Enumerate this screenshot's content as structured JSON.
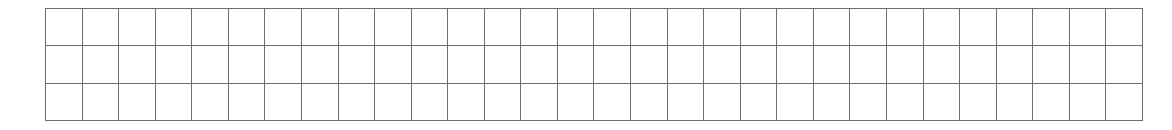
{
  "grid": {
    "rows": 3,
    "columns": 30,
    "line_color": "#6e6e6e",
    "background": "#ffffff",
    "cells_filled": []
  }
}
